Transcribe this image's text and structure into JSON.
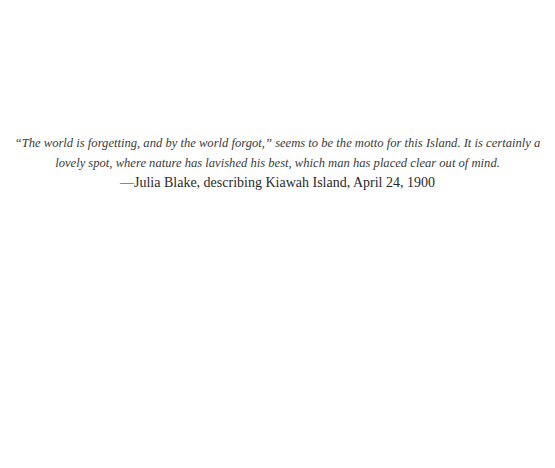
{
  "epigraph": {
    "quote_line1": "“The world is forgetting, and by the world forgot,” seems to be the motto for this Island. It is certainly a",
    "quote_line2": "lovely spot, where nature has lavished his best, which man has placed clear out of mind.",
    "attribution": "—Julia Blake, describing Kiawah Island, April 24, 1900"
  }
}
